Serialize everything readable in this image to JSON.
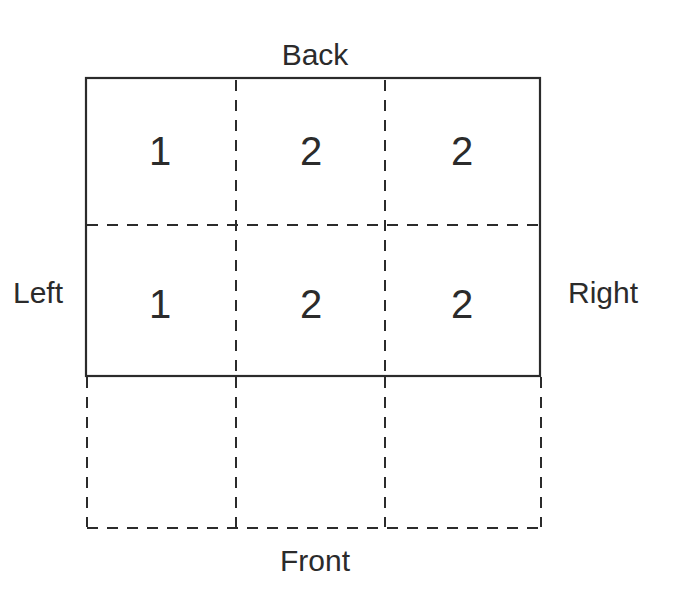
{
  "diagram": {
    "labels": {
      "top": "Back",
      "left": "Left",
      "right": "Right",
      "bottom": "Front"
    },
    "grid": {
      "rows": [
        {
          "cells": [
            "1",
            "2",
            "2"
          ],
          "region": "inside-solid-boundary"
        },
        {
          "cells": [
            "1",
            "2",
            "2"
          ],
          "region": "inside-solid-boundary"
        },
        {
          "cells": [
            "",
            "",
            ""
          ],
          "region": "outside-dashed-extension"
        }
      ]
    },
    "colors": {
      "line": "#2b2b2b",
      "text": "#2b2b2b",
      "background": "#ffffff"
    }
  }
}
